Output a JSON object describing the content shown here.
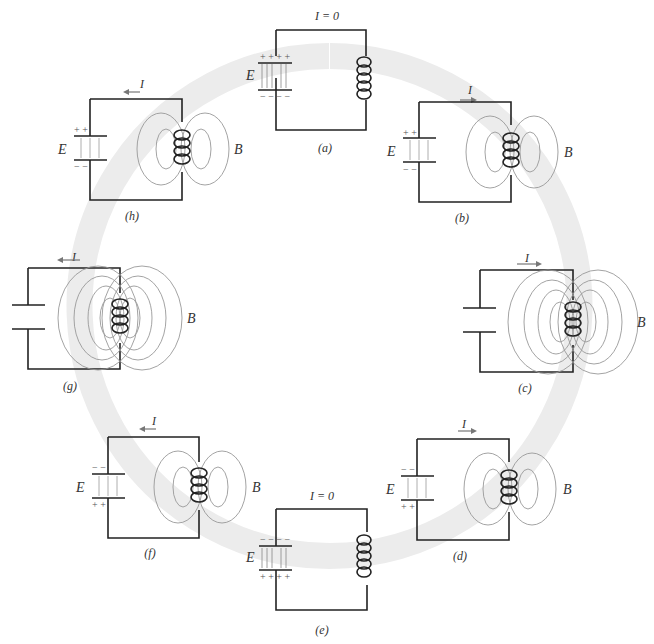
{
  "figure": {
    "colors": {
      "wire": "#222222",
      "field_lines": "#8a8a8a",
      "background_ring": "#ebebeb"
    },
    "panels": [
      {
        "id": "a",
        "caption": "(a)",
        "current_label": "I = 0",
        "capacitor": {
          "label": "E",
          "top": "+ + + +",
          "bottom": "− − − −",
          "field_dir": "down"
        },
        "field_label": ""
      },
      {
        "id": "b",
        "caption": "(b)",
        "current_label": "I",
        "current_dir": "right",
        "capacitor": {
          "label": "E",
          "top": "+   +",
          "bottom": "−   −",
          "field_dir": "down"
        },
        "field_label": "B",
        "b_dir": "up"
      },
      {
        "id": "c",
        "caption": "(c)",
        "current_label": "I",
        "current_dir": "right",
        "capacitor": {
          "label": "",
          "top": "",
          "bottom": ""
        },
        "field_label": "B",
        "b_dir": "up"
      },
      {
        "id": "d",
        "caption": "(d)",
        "current_label": "I",
        "current_dir": "right",
        "capacitor": {
          "label": "E",
          "top": "−   −",
          "bottom": "+   +",
          "field_dir": "up"
        },
        "field_label": "B",
        "b_dir": "up"
      },
      {
        "id": "e",
        "caption": "(e)",
        "current_label": "I = 0",
        "capacitor": {
          "label": "E",
          "top": "− − − −",
          "bottom": "+ + + +",
          "field_dir": "up"
        },
        "field_label": ""
      },
      {
        "id": "f",
        "caption": "(f)",
        "current_label": "I",
        "current_dir": "left",
        "capacitor": {
          "label": "E",
          "top": "−   −",
          "bottom": "+   +",
          "field_dir": "up"
        },
        "field_label": "B",
        "b_dir": "down"
      },
      {
        "id": "g",
        "caption": "(g)",
        "current_label": "I",
        "current_dir": "left",
        "capacitor": {
          "label": "",
          "top": "",
          "bottom": ""
        },
        "field_label": "B",
        "b_dir": "down"
      },
      {
        "id": "h",
        "caption": "(h)",
        "current_label": "I",
        "current_dir": "left",
        "capacitor": {
          "label": "E",
          "top": "+   +",
          "bottom": "−   −",
          "field_dir": "down"
        },
        "field_label": "B",
        "b_dir": "down"
      }
    ]
  }
}
